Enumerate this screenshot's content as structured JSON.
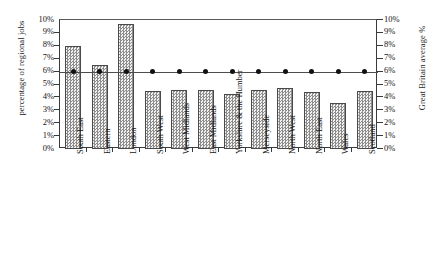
{
  "chart_data": {
    "type": "bar",
    "title": "",
    "xlabel": "",
    "ylabel": "percentage of regional jobs",
    "y2label": "Great Britain average %",
    "ylim": [
      0,
      10
    ],
    "y2lim": [
      0,
      10
    ],
    "grid": false,
    "legend": "none",
    "ytick_labels": [
      "10%",
      "9%",
      "8%",
      "7%",
      "6%",
      "5%",
      "4%",
      "3%",
      "2%",
      "1%",
      "0%"
    ],
    "y2tick_labels": [
      "10%",
      "9%",
      "8%",
      "7%",
      "6%",
      "5%",
      "4%",
      "3%",
      "2%",
      "1%",
      "0%"
    ],
    "categories": [
      "South East",
      "Eastern",
      "London",
      "South West",
      "West Midlands",
      "East Midlands",
      "Yorkshire & the Humber",
      "Merseyside",
      "North West",
      "North East",
      "Wales",
      "Scotland"
    ],
    "series": [
      {
        "name": "percentage of regional jobs",
        "type": "bar",
        "values": [
          8.0,
          6.5,
          9.7,
          4.5,
          4.6,
          4.6,
          4.3,
          4.6,
          4.7,
          4.4,
          3.6,
          4.5
        ]
      },
      {
        "name": "Great Britain average %",
        "type": "line",
        "values": [
          6.0,
          6.0,
          6.0,
          6.0,
          6.0,
          6.0,
          6.0,
          6.0,
          6.0,
          6.0,
          6.0,
          6.0
        ]
      }
    ]
  }
}
